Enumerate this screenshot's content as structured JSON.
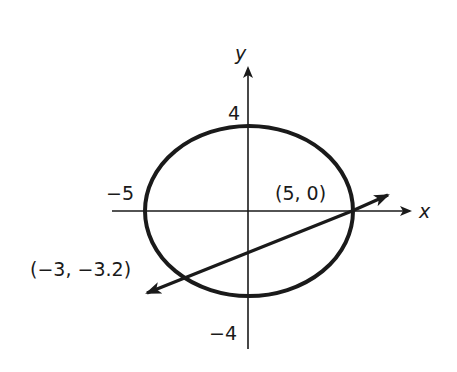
{
  "diagram": {
    "type": "coordinate-graph",
    "axes": {
      "x_label": "x",
      "y_label": "y"
    },
    "ticks": {
      "x_neg": "−5",
      "y_pos": "4",
      "y_neg": "−4"
    },
    "ellipse": {
      "description": "Ellipse centered at origin with horizontal semi-axis 5 and vertical semi-axis 4",
      "a": 5,
      "b": 4
    },
    "line": {
      "description": "Line intersecting the ellipse at two points",
      "through": [
        [
          5,
          0
        ],
        [
          -3,
          -3.2
        ]
      ]
    },
    "points": [
      {
        "label": "(5, 0)",
        "x": 5,
        "y": 0
      },
      {
        "label": "(−3, −3.2)",
        "x": -3,
        "y": -3.2
      }
    ],
    "colors": {
      "stroke": "#1a1a1a",
      "background": "#ffffff"
    }
  }
}
